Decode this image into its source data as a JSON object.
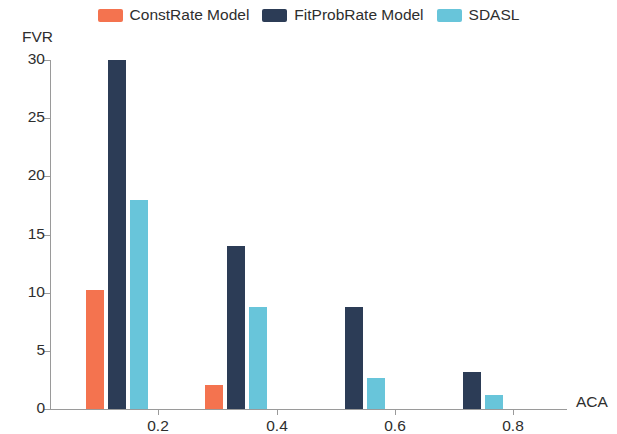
{
  "chart_data": {
    "type": "bar",
    "title": "",
    "subtitle": "",
    "xlabel": "ACA",
    "ylabel": "FVR",
    "categories": [
      "0.2",
      "0.4",
      "0.6",
      "0.8"
    ],
    "series": [
      {
        "name": "ConstRate Model",
        "color": "#f4734f",
        "values": [
          10.2,
          2.1,
          0,
          0
        ]
      },
      {
        "name": "FitProbRate Model",
        "color": "#2c3c56",
        "values": [
          30.0,
          14.0,
          8.8,
          3.2
        ]
      },
      {
        "name": "SDASL",
        "color": "#68c5da",
        "values": [
          18.0,
          8.8,
          2.7,
          1.2
        ]
      }
    ],
    "ylim": [
      0,
      30
    ],
    "yticks": [
      0,
      5,
      10,
      15,
      20,
      25,
      30
    ],
    "ytick_labels": [
      "0",
      "5",
      "10",
      "15",
      "20",
      "25",
      "30"
    ],
    "xtick_labels": [
      "0.2",
      "0.4",
      "0.6",
      "0.8"
    ],
    "grid": false,
    "legend_position": "top-center"
  }
}
